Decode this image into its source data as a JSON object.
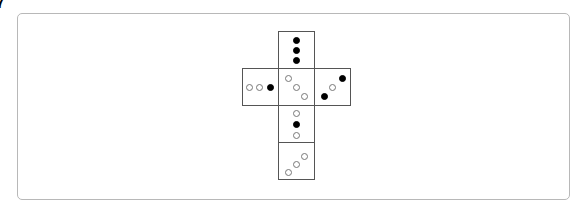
{
  "figure": {
    "label": "7"
  },
  "net": {
    "faces": [
      {
        "name": "top",
        "x": 278,
        "y": 31,
        "pips": [
          {
            "x": 14,
            "y": 5,
            "filled": true
          },
          {
            "x": 14,
            "y": 15,
            "filled": true
          },
          {
            "x": 14,
            "y": 25,
            "filled": true
          }
        ]
      },
      {
        "name": "left",
        "x": 242,
        "y": 68,
        "pips": [
          {
            "x": 3,
            "y": 15,
            "filled": false
          },
          {
            "x": 13,
            "y": 15,
            "filled": false
          },
          {
            "x": 24,
            "y": 15,
            "filled": true
          }
        ]
      },
      {
        "name": "center",
        "x": 278,
        "y": 68,
        "pips": [
          {
            "x": 6,
            "y": 6,
            "filled": false
          },
          {
            "x": 14,
            "y": 15,
            "filled": false
          },
          {
            "x": 22,
            "y": 24,
            "filled": false
          }
        ]
      },
      {
        "name": "right",
        "x": 314,
        "y": 68,
        "pips": [
          {
            "x": 6,
            "y": 24,
            "filled": true
          },
          {
            "x": 14,
            "y": 15,
            "filled": false
          },
          {
            "x": 24,
            "y": 6,
            "filled": true
          }
        ]
      },
      {
        "name": "lower",
        "x": 278,
        "y": 105,
        "pips": [
          {
            "x": 14,
            "y": 4,
            "filled": false
          },
          {
            "x": 14,
            "y": 15,
            "filled": true
          },
          {
            "x": 14,
            "y": 26,
            "filled": false
          }
        ]
      },
      {
        "name": "bottom",
        "x": 278,
        "y": 142,
        "pips": [
          {
            "x": 6,
            "y": 26,
            "filled": false
          },
          {
            "x": 14,
            "y": 18,
            "filled": false
          },
          {
            "x": 22,
            "y": 10,
            "filled": false
          }
        ]
      }
    ]
  }
}
